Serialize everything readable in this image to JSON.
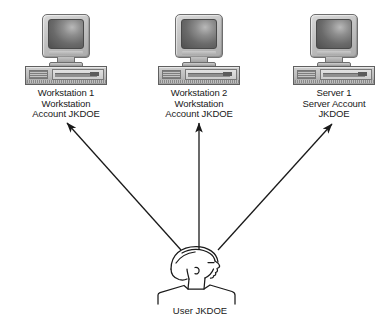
{
  "diagram": {
    "background_color": "#ffffff",
    "line_color": "#1a1a1a",
    "nodes": [
      {
        "id": "workstation-1",
        "icon": "desktop-computer-icon",
        "caption": "Workstation 1\nWorkstation\nAccount JKDOE",
        "x": 66,
        "y": 14
      },
      {
        "id": "workstation-2",
        "icon": "desktop-computer-icon",
        "caption": "Workstation 2\nWorkstation\nAccount JKDOE",
        "x": 199,
        "y": 14
      },
      {
        "id": "server-1",
        "icon": "desktop-computer-icon",
        "caption": "Server 1\nServer Account\nJKDOE",
        "x": 334,
        "y": 14
      }
    ],
    "user": {
      "id": "user-jkdoe",
      "icon": "user-head-profile-icon",
      "caption": "User JKDOE"
    },
    "arrows": [
      {
        "id": "arrow-to-workstation-1",
        "from": "user-jkdoe",
        "to": "workstation-1",
        "x1": 181,
        "y1": 250,
        "x2": 67,
        "y2": 123
      },
      {
        "id": "arrow-to-workstation-2",
        "from": "user-jkdoe",
        "to": "workstation-2",
        "x1": 199,
        "y1": 249,
        "x2": 199,
        "y2": 123
      },
      {
        "id": "arrow-to-server-1",
        "from": "user-jkdoe",
        "to": "server-1",
        "x1": 218,
        "y1": 250,
        "x2": 332,
        "y2": 124
      }
    ]
  }
}
